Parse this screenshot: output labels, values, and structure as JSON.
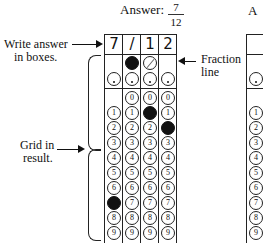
{
  "answer": {
    "label": "Answer:",
    "fraction_numerator": "7",
    "fraction_denominator": "12"
  },
  "boxes": [
    "7",
    "/",
    "1",
    "2"
  ],
  "annotations": {
    "write_answer_line1": "Write answer",
    "write_answer_line2": "in boxes.",
    "fraction_line_line1": "Fraction",
    "fraction_line_line2": "line",
    "grid_in_line1": "Grid in",
    "grid_in_line2": "result."
  },
  "grid": {
    "columns": 4,
    "slash_row": {
      "columns_with_slash": [
        1,
        2
      ],
      "filled_column": 1
    },
    "decimal_row": {
      "columns_with_decimal": [
        0,
        1,
        2,
        3
      ]
    },
    "digit_rows": [
      "0",
      "1",
      "2",
      "3",
      "4",
      "5",
      "6",
      "7",
      "8",
      "9"
    ],
    "digit_columns_start": {
      "col0": 1,
      "col1": 0,
      "col2": 0,
      "col3": 0
    },
    "filled": [
      {
        "column": 0,
        "digit": "7"
      },
      {
        "column": 1,
        "slash": true
      },
      {
        "column": 2,
        "digit": "1"
      },
      {
        "column": 3,
        "digit": "2"
      }
    ]
  },
  "right_partial": {
    "answer_label_fragment": "A",
    "digits": [
      "1",
      "2",
      "3",
      "4",
      "5",
      "6",
      "7",
      "8",
      "9"
    ]
  }
}
